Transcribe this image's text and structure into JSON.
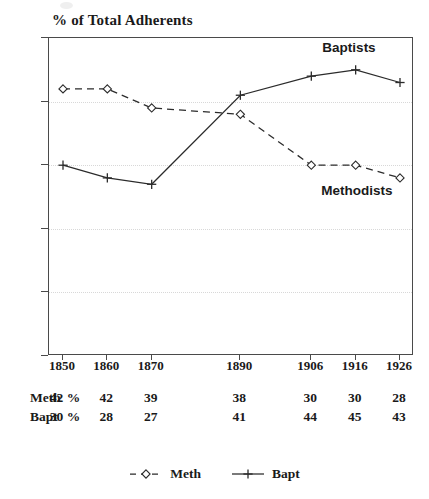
{
  "chart_data": {
    "type": "line",
    "title": "% of Total Adherents",
    "xlabel": "",
    "ylabel": "",
    "ylim": [
      0,
      50
    ],
    "yticks": [
      0,
      10,
      20,
      30,
      40,
      50
    ],
    "grid": true,
    "legend_position": "bottom-center",
    "categories": [
      "1850",
      "1860",
      "1870",
      "1890",
      "1906",
      "1916",
      "1926"
    ],
    "x_numeric": [
      1850,
      1860,
      1870,
      1890,
      1906,
      1916,
      1926
    ],
    "series": [
      {
        "name": "Meth",
        "display_name": "Methodists",
        "marker": "diamond-open",
        "line_style": "dashed",
        "color": "#2b2b2b",
        "values": [
          42,
          42,
          39,
          38,
          30,
          30,
          28
        ],
        "value_labels": [
          "42 %",
          "42",
          "39",
          "38",
          "30",
          "30",
          "28"
        ]
      },
      {
        "name": "Bapt",
        "display_name": "Baptists",
        "marker": "plus",
        "line_style": "solid",
        "color": "#2b2b2b",
        "values": [
          30,
          28,
          27,
          41,
          44,
          45,
          43
        ],
        "value_labels": [
          "30 %",
          "28",
          "27",
          "41",
          "44",
          "45",
          "43"
        ]
      }
    ],
    "annotations": [
      {
        "text": "Baptists",
        "series": "Bapt"
      },
      {
        "text": "Methodists",
        "series": "Meth"
      }
    ]
  },
  "axis": {
    "y_tick_labels": [
      "0",
      "10",
      "20",
      "30",
      "40",
      "50"
    ],
    "x_tick_labels": [
      "1850",
      "1860",
      "1870",
      "1890",
      "1906",
      "1916",
      "1926"
    ]
  },
  "table": {
    "rows": [
      {
        "label": "Meth",
        "cells": [
          "42 %",
          "42",
          "39",
          "38",
          "30",
          "30",
          "28"
        ]
      },
      {
        "label": "Bapt",
        "cells": [
          "30 %",
          "28",
          "27",
          "41",
          "44",
          "45",
          "43"
        ]
      }
    ]
  },
  "legend": {
    "items": [
      {
        "label": "Meth",
        "marker": "diamond-open",
        "line_style": "dashed"
      },
      {
        "label": "Bapt",
        "marker": "plus",
        "line_style": "solid"
      }
    ]
  },
  "colors": {
    "ink": "#1a1a1a",
    "axis": "#4a4a4a",
    "grid": "#d8d8d8",
    "series": "#2b2b2b",
    "background": "#ffffff"
  }
}
